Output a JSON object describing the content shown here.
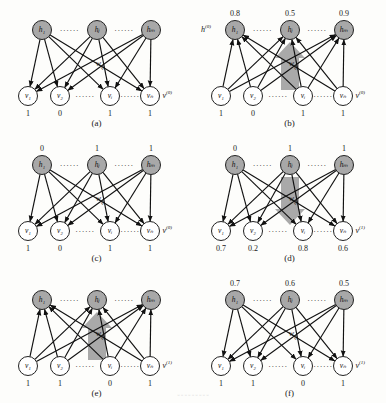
{
  "figure": {
    "title_note": "",
    "colors": {
      "hidden_node_fill": "#a8a8a8",
      "visible_node_fill": "#ffffff",
      "node_stroke": "#222222",
      "edge": "#111111",
      "arrow_shape": "#9a9a9a",
      "background": "#fdfdfb",
      "text": "#111111"
    },
    "node_labels": {
      "hidden": [
        "h₁",
        "hⱼ",
        "hₘ"
      ],
      "visible": [
        "v₁",
        "v₂",
        "vᵢ",
        "vₙ"
      ]
    },
    "weight_label": "w",
    "weight_label_sub": "ij",
    "ellipsis": "······"
  },
  "panels": [
    {
      "id": "a",
      "caption": "(a)",
      "hidden_values": [],
      "visible_values": [
        "1",
        "0",
        "1",
        "1"
      ],
      "hidden_state_label": "",
      "hidden_state_sup": "",
      "visible_state_label": "v",
      "visible_state_sup": "(0)",
      "arrow": "none",
      "show_weight_label": true
    },
    {
      "id": "b",
      "caption": "(b)",
      "hidden_values": [
        "0.8",
        "0.5",
        "0.9"
      ],
      "visible_values": [
        "1",
        "0",
        "1",
        "1"
      ],
      "hidden_state_label": "h",
      "hidden_state_sup": "(0)",
      "visible_state_label": "v",
      "visible_state_sup": "(0)",
      "arrow": "up",
      "show_weight_label": true
    },
    {
      "id": "c",
      "caption": "(c)",
      "hidden_values": [
        "0",
        "1",
        "1"
      ],
      "visible_values": [
        "1",
        "0",
        "1",
        "1"
      ],
      "hidden_state_label": "",
      "hidden_state_sup": "",
      "visible_state_label": "v",
      "visible_state_sup": "(0)",
      "arrow": "none",
      "show_weight_label": true
    },
    {
      "id": "d",
      "caption": "(d)",
      "hidden_values": [
        "0",
        "1",
        "1"
      ],
      "visible_values": [
        "0.7",
        "0.2",
        "0.8",
        "0.6"
      ],
      "hidden_state_label": "",
      "hidden_state_sup": "",
      "visible_state_label": "v",
      "visible_state_sup": "(1)",
      "arrow": "down",
      "show_weight_label": true
    },
    {
      "id": "e",
      "caption": "(e)",
      "hidden_values": [],
      "visible_values": [
        "1",
        "1",
        "0",
        "1"
      ],
      "hidden_state_label": "",
      "hidden_state_sup": "",
      "visible_state_label": "v",
      "visible_state_sup": "(1)",
      "arrow": "up",
      "show_weight_label": true
    },
    {
      "id": "f",
      "caption": "(f)",
      "hidden_values": [
        "0.7",
        "0.6",
        "0.5"
      ],
      "visible_values": [
        "1",
        "1",
        "0",
        "1"
      ],
      "hidden_state_label": "",
      "hidden_state_sup": "",
      "visible_state_label": "v",
      "visible_state_sup": "(1)",
      "arrow": "none",
      "show_weight_label": true
    }
  ],
  "bottom_note": "▫ ▫ ▫  ▫ ▫ ▫ ▫ ▫ ▫"
}
